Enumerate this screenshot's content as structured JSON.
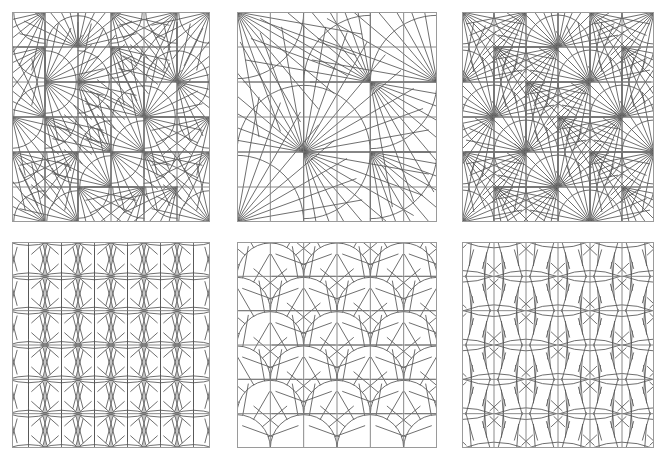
{
  "figure": {
    "width": 665,
    "height": 458,
    "background_color": "#ffffff",
    "rows": 2,
    "columns": 3,
    "panel_count": 6
  },
  "style": {
    "frame_color": "#9a9a9a",
    "grid_color": "#7d7d7d",
    "motif_color": "#555555",
    "frame_width": 1,
    "grid_width": 0.9,
    "motif_width": 0.85
  },
  "panels": [
    {
      "index": 0,
      "name": "panel-top-left",
      "label": "",
      "x": 12,
      "y": 12,
      "width": 198,
      "height": 210,
      "grid_divisions": 6,
      "motif": "fan-quarter-arc",
      "motif_span": 1,
      "rays": 7,
      "arc_radius_ratio": 0.95,
      "orientation_mode": "alternating",
      "description": "6 by 6 grid of quarter-circle fan cells with radiating spokes, orientation alternating cell to cell"
    },
    {
      "index": 1,
      "name": "panel-top-middle",
      "label": "",
      "x": 237,
      "y": 12,
      "width": 200,
      "height": 210,
      "grid_divisions": 6,
      "motif": "fan-quarter-arc",
      "motif_span": 2,
      "rays": 9,
      "arc_radius_ratio": 1.0,
      "orientation_mode": "alternating",
      "description": "6 by 6 grid with large quarter-circle fans spanning 2 by 2 cells, sparse long spokes"
    },
    {
      "index": 2,
      "name": "panel-top-right",
      "label": "",
      "x": 462,
      "y": 12,
      "width": 192,
      "height": 210,
      "grid_divisions": 6,
      "motif": "fan-quarter-arc",
      "motif_span": 1,
      "rays": 8,
      "arc_radius_ratio": 1.0,
      "orientation_mode": "rotating",
      "description": "6 by 6 grid of quarter-circle fans rotating through four orientations"
    },
    {
      "index": 3,
      "name": "panel-bottom-left",
      "label": "",
      "x": 12,
      "y": 242,
      "width": 198,
      "height": 206,
      "grid_divisions": 6,
      "motif": "lens-burst",
      "motif_span": 1,
      "rays": 10,
      "arc_radius_ratio": 0.62,
      "orientation_mode": "uniform",
      "description": "Horizontal lens (vesica) shapes centred on grid intersections with radiating spokes above and below"
    },
    {
      "index": 4,
      "name": "panel-bottom-middle",
      "label": "",
      "x": 237,
      "y": 242,
      "width": 200,
      "height": 206,
      "grid_divisions": 6,
      "motif": "semicircle-fan",
      "motif_span": 2,
      "rays": 9,
      "arc_radius_ratio": 1.0,
      "orientation_mode": "uniform",
      "description": "Half-circle fans spanning 2 cells wide, arranged in offset rows with spokes radiating from the arc apex"
    },
    {
      "index": 5,
      "name": "panel-bottom-right",
      "label": "",
      "x": 462,
      "y": 242,
      "width": 192,
      "height": 206,
      "grid_divisions": 6,
      "motif": "lens-star",
      "motif_span": 2,
      "rays": 12,
      "arc_radius_ratio": 0.9,
      "orientation_mode": "checkerboard",
      "description": "Wide lens shapes spanning 2 cells arranged on a checkerboard offset, each surrounded by a star burst of spokes"
    }
  ]
}
